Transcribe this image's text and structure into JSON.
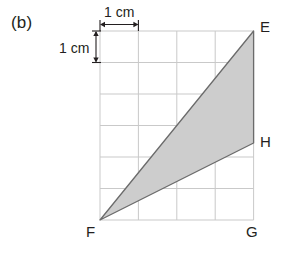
{
  "figure": {
    "part_label": "(b)",
    "background_color": "#ffffff",
    "grid": {
      "columns": 5,
      "rows": 6,
      "cell_size_cm": 1,
      "line_color": "#c9c9c9",
      "x_left_px": 100,
      "y_top_px": 31,
      "cell_width_px": 38.4,
      "cell_height_px": 31.5
    },
    "scale_labels": {
      "horizontal": "1 cm",
      "vertical": "1 cm",
      "arrow_color": "#231f20"
    },
    "shape": {
      "name": "triangle-EFH",
      "fill_color": "#cdcdcd",
      "stroke_color": "#6b6b6b",
      "vertices": [
        {
          "label": "E",
          "grid_x": 5,
          "grid_y": 0
        },
        {
          "label": "H",
          "grid_x": 5,
          "grid_y": 3.55
        },
        {
          "label": "F",
          "grid_x": 0,
          "grid_y": 6
        }
      ]
    },
    "vertex_labels": [
      {
        "name": "E",
        "text": "E"
      },
      {
        "name": "H",
        "text": "H"
      },
      {
        "name": "F",
        "text": "F"
      },
      {
        "name": "G",
        "text": "G"
      }
    ],
    "corner_labels": {
      "E": "E",
      "H": "H",
      "F": "F",
      "G": "G"
    }
  }
}
